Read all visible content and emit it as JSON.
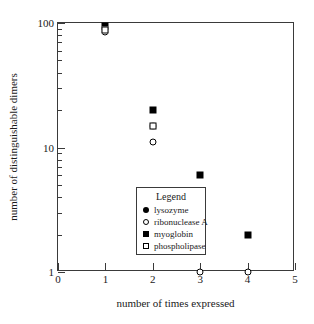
{
  "chart_data": {
    "type": "scatter",
    "title": "",
    "xlabel": "number of times expressed",
    "ylabel": "number of distinguishable dimers",
    "xlim": [
      0,
      5
    ],
    "ylim": [
      1,
      100
    ],
    "yscale": "log",
    "xscale": "linear",
    "grid": false,
    "legend_position": "inside-lower-left",
    "legend_title": "Legend",
    "xticks": [
      "0",
      "1",
      "2",
      "3",
      "4",
      "5"
    ],
    "xtick_values": [
      0,
      1,
      2,
      3,
      4,
      5
    ],
    "yticks": [
      "1",
      "10",
      "100"
    ],
    "ytick_values": [
      1,
      10,
      100
    ],
    "yminor_values": [
      2,
      3,
      4,
      5,
      6,
      7,
      8,
      9,
      20,
      30,
      40,
      50,
      60,
      70,
      80,
      90
    ],
    "series": [
      {
        "name": "lysozyme",
        "marker": "filled-circle",
        "color": "#000000",
        "x": [
          1,
          2
        ],
        "y": [
          90,
          15
        ]
      },
      {
        "name": "ribonuclease A",
        "marker": "open-circle",
        "color": "#000000",
        "x": [
          1,
          2,
          3,
          4
        ],
        "y": [
          85,
          11,
          1,
          1
        ]
      },
      {
        "name": "myoglobin",
        "marker": "filled-square",
        "color": "#000000",
        "x": [
          1,
          2,
          3,
          4
        ],
        "y": [
          95,
          20,
          6,
          2
        ]
      },
      {
        "name": "phospholipase",
        "marker": "open-square",
        "color": "#000000",
        "x": [
          1,
          2,
          3
        ],
        "y": [
          88,
          15,
          2
        ]
      }
    ]
  }
}
